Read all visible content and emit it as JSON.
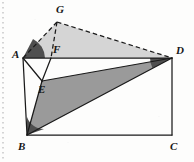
{
  "figure": {
    "caption": "",
    "canvas": {
      "width": 194,
      "height": 162,
      "background": "#fdfdfc"
    },
    "colors": {
      "stroke": "#1a1a1a",
      "light_fill": "#d5d5d5",
      "mid_fill": "#9a9a9a",
      "dark_fill": "#5a5a5a",
      "background": "#fdfdfc",
      "margin_dots": "#b9b9b9"
    },
    "points": [
      {
        "id": "A",
        "label": "A",
        "x": 23,
        "y": 58,
        "label_x": 12,
        "label_y": 49
      },
      {
        "id": "B",
        "label": "B",
        "x": 27,
        "y": 135,
        "label_x": 18,
        "label_y": 141
      },
      {
        "id": "C",
        "label": "C",
        "x": 172,
        "y": 135,
        "label_x": 170,
        "label_y": 141
      },
      {
        "id": "D",
        "label": "D",
        "x": 172,
        "y": 58,
        "label_x": 176,
        "label_y": 45
      },
      {
        "id": "E",
        "label": "E",
        "x": 42,
        "y": 81,
        "label_x": 38,
        "label_y": 84
      },
      {
        "id": "F",
        "label": "F",
        "x": 51,
        "y": 58,
        "label_x": 53,
        "label_y": 44
      },
      {
        "id": "G",
        "label": "G",
        "x": 57,
        "y": 22,
        "label_x": 56,
        "label_y": 4
      }
    ],
    "regions": [
      {
        "id": "triangle-AGD",
        "name": "triangle-agd-light",
        "vertices": "A,G,D",
        "fill": "#d5d5d5"
      },
      {
        "id": "triangle-BED",
        "name": "triangle-bed-mid",
        "vertices": "B,E,D",
        "fill": "#9a9a9a"
      }
    ],
    "solid_edges": [
      {
        "id": "AB",
        "from": "A",
        "to": "B"
      },
      {
        "id": "BC",
        "from": "B",
        "to": "C"
      },
      {
        "id": "CD",
        "from": "C",
        "to": "D"
      },
      {
        "id": "AD",
        "from": "A",
        "to": "D"
      },
      {
        "id": "AE",
        "from": "A",
        "to": "E"
      },
      {
        "id": "BE",
        "from": "B",
        "to": "E"
      },
      {
        "id": "BD",
        "from": "B",
        "to": "D"
      },
      {
        "id": "ED",
        "from": "E",
        "to": "D"
      },
      {
        "id": "FE",
        "from": "F",
        "to": "E"
      }
    ],
    "dashed_edges": [
      {
        "id": "AG",
        "from": "A",
        "to": "G"
      },
      {
        "id": "GD",
        "from": "G",
        "to": "D"
      },
      {
        "id": "GF",
        "from": "G",
        "to": "F"
      }
    ],
    "angle_marks": [
      {
        "id": "angle-A",
        "at": "A",
        "name": "angle-marker-a"
      },
      {
        "id": "angle-B",
        "at": "B",
        "name": "angle-marker-b"
      },
      {
        "id": "angle-D",
        "at": "D",
        "name": "angle-marker-d"
      }
    ],
    "margin_marks": {
      "name": "page-margin-dots",
      "x": 3,
      "visible": true
    }
  }
}
